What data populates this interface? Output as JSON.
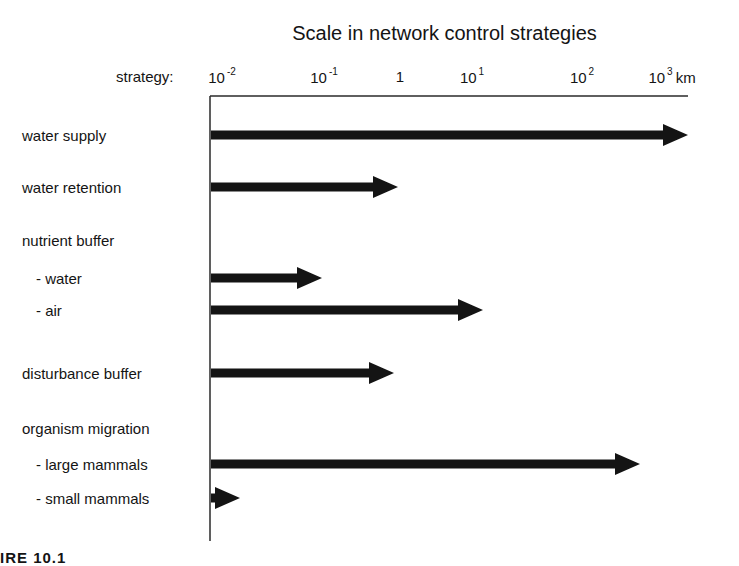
{
  "title": "Scale in network control strategies",
  "axis": {
    "label": "strategy:",
    "unit": "km",
    "ticks": [
      {
        "base": "10",
        "exp": "-2",
        "x": 222
      },
      {
        "base": "10",
        "exp": "-1",
        "x": 324
      },
      {
        "base": "1",
        "exp": "",
        "x": 400
      },
      {
        "base": "10",
        "exp": "1",
        "x": 472
      },
      {
        "base": "10",
        "exp": "2",
        "x": 582
      },
      {
        "base": "10",
        "exp": "3",
        "x": 672
      }
    ]
  },
  "rows": [
    {
      "label": "water supply",
      "indent": false,
      "y": 135,
      "has_arrow": true
    },
    {
      "label": "water retention",
      "indent": false,
      "y": 187,
      "has_arrow": true
    },
    {
      "label": "nutrient buffer",
      "indent": false,
      "y": 240,
      "has_arrow": false
    },
    {
      "label": "- water",
      "indent": true,
      "y": 278,
      "has_arrow": true
    },
    {
      "label": "- air",
      "indent": true,
      "y": 310,
      "has_arrow": true
    },
    {
      "label": "disturbance buffer",
      "indent": false,
      "y": 373,
      "has_arrow": true
    },
    {
      "label": "organism migration",
      "indent": false,
      "y": 428,
      "has_arrow": false
    },
    {
      "label": "- large mammals",
      "indent": true,
      "y": 464,
      "has_arrow": true
    },
    {
      "label": "- small mammals",
      "indent": true,
      "y": 498,
      "has_arrow": true
    }
  ],
  "caption": "IRE 10.1",
  "colors": {
    "ink": "#141414",
    "background": "#ffffff"
  },
  "chart_data": {
    "type": "bar",
    "orientation": "horizontal",
    "title": "Scale in network control strategies",
    "xlabel": "strategy: spatial scale (km, log scale)",
    "x_scale": "log",
    "xlim": [
      0.01,
      1000
    ],
    "x_ticks": [
      "10^-2",
      "10^-1",
      "1",
      "10^1",
      "10^2",
      "10^3 km"
    ],
    "categories": [
      "water supply",
      "water retention",
      "nutrient buffer - water",
      "nutrient buffer - air",
      "disturbance buffer",
      "organism migration - large mammals",
      "organism migration - small mammals"
    ],
    "values_km": [
      1000,
      1,
      0.1,
      10,
      1,
      300,
      0.015
    ],
    "bars": [
      {
        "label": "water supply",
        "start": 0.01,
        "end": 1000,
        "tip_x": 688
      },
      {
        "label": "water retention",
        "start": 0.01,
        "end": 1,
        "tip_x": 398
      },
      {
        "label": "nutrient buffer - water",
        "start": 0.01,
        "end": 0.1,
        "tip_x": 322
      },
      {
        "label": "nutrient buffer - air",
        "start": 0.01,
        "end": 10,
        "tip_x": 483
      },
      {
        "label": "disturbance buffer",
        "start": 0.01,
        "end": 1,
        "tip_x": 394
      },
      {
        "label": "organism migration - large mammals",
        "start": 0.01,
        "end": 300,
        "tip_x": 640
      },
      {
        "label": "organism migration - small mammals",
        "start": 0.01,
        "end": 0.015,
        "tip_x": 240
      }
    ],
    "grid": false,
    "legend": "none"
  }
}
